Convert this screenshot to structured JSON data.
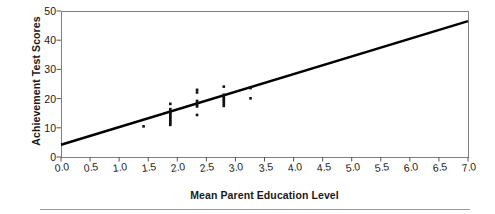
{
  "chart_data": {
    "type": "scatter",
    "title": "",
    "xlabel": "Mean Parent Education Level",
    "ylabel": "Achievement Test Scores",
    "xlim": [
      0.0,
      7.0
    ],
    "ylim": [
      0,
      50
    ],
    "xticks": [
      "0.0",
      "0.5",
      "1.0",
      "1.5",
      "2.0",
      "2.5",
      "3.0",
      "3.5",
      "4.0",
      "4.5",
      "5.0",
      "5.5",
      "6.0",
      "6.5",
      "7.0"
    ],
    "xtick_values": [
      0.0,
      0.5,
      1.0,
      1.5,
      2.0,
      2.5,
      3.0,
      3.5,
      4.0,
      4.5,
      5.0,
      5.5,
      6.0,
      6.5,
      7.0
    ],
    "yticks": [
      "0",
      "10",
      "20",
      "30",
      "40",
      "50"
    ],
    "ytick_values": [
      0,
      10,
      20,
      30,
      40,
      50
    ],
    "grid": false,
    "legend": false,
    "marker": "square",
    "marker_color": "#111111",
    "points": [
      {
        "x": 1.42,
        "y": 10.5
      },
      {
        "x": 1.88,
        "y": 18.2
      },
      {
        "x": 1.88,
        "y": 16.4
      },
      {
        "x": 1.88,
        "y": 15.7
      },
      {
        "x": 1.88,
        "y": 15.1
      },
      {
        "x": 1.88,
        "y": 14.6
      },
      {
        "x": 1.88,
        "y": 14.0
      },
      {
        "x": 1.88,
        "y": 13.4
      },
      {
        "x": 1.88,
        "y": 12.8
      },
      {
        "x": 1.88,
        "y": 12.2
      },
      {
        "x": 1.88,
        "y": 11.6
      },
      {
        "x": 1.88,
        "y": 11.0
      },
      {
        "x": 2.34,
        "y": 23.0
      },
      {
        "x": 2.34,
        "y": 22.1
      },
      {
        "x": 2.34,
        "y": 19.2
      },
      {
        "x": 2.34,
        "y": 18.5
      },
      {
        "x": 2.34,
        "y": 17.9
      },
      {
        "x": 2.34,
        "y": 17.3
      },
      {
        "x": 2.34,
        "y": 14.4
      },
      {
        "x": 2.8,
        "y": 24.1
      },
      {
        "x": 2.8,
        "y": 21.3
      },
      {
        "x": 2.8,
        "y": 20.7
      },
      {
        "x": 2.8,
        "y": 20.1
      },
      {
        "x": 2.8,
        "y": 19.5
      },
      {
        "x": 2.8,
        "y": 18.9
      },
      {
        "x": 2.8,
        "y": 18.2
      },
      {
        "x": 2.8,
        "y": 17.5
      },
      {
        "x": 3.26,
        "y": 23.6
      },
      {
        "x": 3.26,
        "y": 20.1
      }
    ],
    "regression_line": {
      "x0": 0.0,
      "y0": 4.2,
      "x1": 7.0,
      "y1": 46.5,
      "color": "#000000",
      "width": 2.4
    },
    "frame_color": "#808080",
    "background": "#ffffff"
  }
}
